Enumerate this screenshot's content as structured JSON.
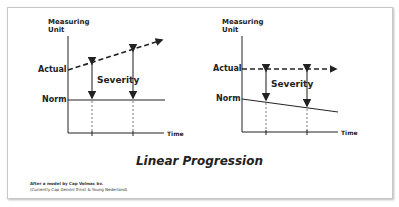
{
  "title": "Linear Progression",
  "credit": {
    "line1": "After a model by Cap Volmac bv.",
    "line2": "(Currently Cap Gemini Ernst & Young Nederland)"
  },
  "left_chart": {
    "y_axis_label_1": "Measuring",
    "y_axis_label_2": "Unit",
    "x_axis_label": "Time",
    "actual_label": "Actual",
    "norm_label": "Norm",
    "severity_label": "Severity",
    "description": "Norm constant, Actual rising (dashed arrow); severity grows over time"
  },
  "right_chart": {
    "y_axis_label_1": "Measuring",
    "y_axis_label_2": "Unit",
    "x_axis_label": "Time",
    "actual_label": "Actual",
    "norm_label": "Norm",
    "severity_label": "Severity",
    "description": "Actual constant (dashed arrow), Norm declining; severity grows over time"
  },
  "colors": {
    "line": "#222222",
    "arrow_shaft": "#666666",
    "frame": "#c8c8c8"
  }
}
